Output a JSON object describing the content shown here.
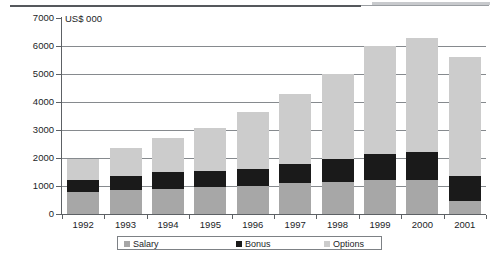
{
  "axis_title": "US$ 000",
  "legend": [
    {
      "label": "Salary",
      "color": "#a7a7a7",
      "key": "salary"
    },
    {
      "label": "Bonus",
      "color": "#1a1a1a",
      "key": "bonus"
    },
    {
      "label": "Options",
      "color": "#cccccc",
      "key": "options"
    }
  ],
  "y_ticks": [
    "0",
    "1000",
    "2000",
    "3000",
    "4000",
    "5000",
    "6000",
    "7000"
  ],
  "chart_data": {
    "type": "bar",
    "title": "",
    "subtitle": "",
    "xlabel": "",
    "ylabel": "US$ 000",
    "ylim": [
      0,
      7000
    ],
    "ytick_step": 1000,
    "grid": true,
    "stacked": true,
    "legend_position": "bottom",
    "categories": [
      "1992",
      "1993",
      "1994",
      "1995",
      "1996",
      "1997",
      "1998",
      "1999",
      "2000",
      "2001"
    ],
    "series": [
      {
        "name": "Salary",
        "color": "#a7a7a7",
        "values": [
          800,
          850,
          900,
          950,
          1000,
          1100,
          1150,
          1200,
          1200,
          450
        ]
      },
      {
        "name": "Bonus",
        "color": "#1a1a1a",
        "values": [
          400,
          500,
          600,
          600,
          620,
          700,
          800,
          950,
          1000,
          900
        ]
      },
      {
        "name": "Options",
        "color": "#cccccc",
        "values": [
          750,
          1000,
          1200,
          1530,
          2030,
          2480,
          3050,
          3850,
          4100,
          4250
        ]
      }
    ],
    "totals": [
      1950,
      2350,
      2700,
      3080,
      3650,
      4280,
      5000,
      6000,
      6300,
      5600
    ]
  }
}
